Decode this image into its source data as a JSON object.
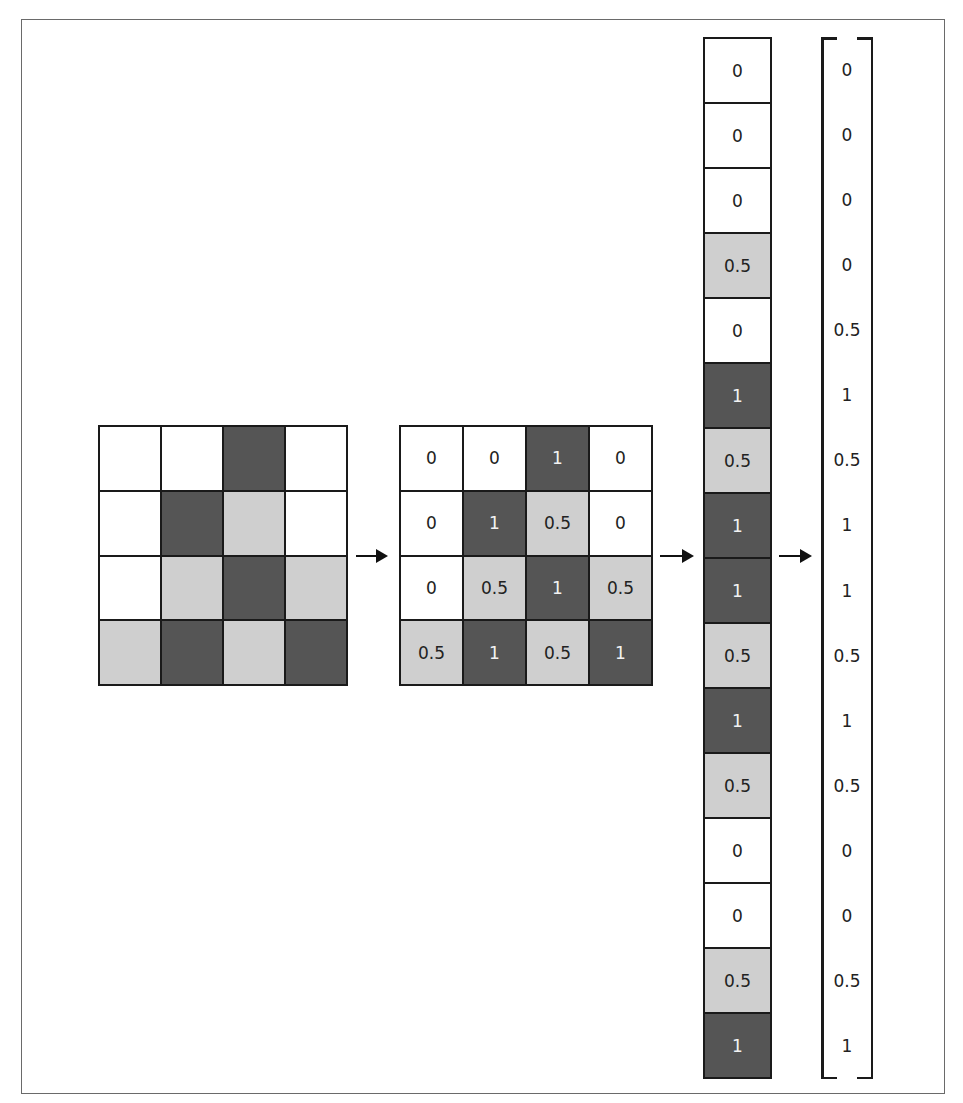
{
  "colors": {
    "white": "#ffffff",
    "light_gray": "#cfcfcf",
    "dark_gray": "#555555",
    "line": "#1a1a1a"
  },
  "legend_mapping": {
    "white": "0",
    "light_gray": "0.5",
    "dark_gray": "1"
  },
  "image_grid": {
    "rows": [
      [
        "0",
        "0",
        "1",
        "0"
      ],
      [
        "0",
        "1",
        "0.5",
        "0"
      ],
      [
        "0",
        "0.5",
        "1",
        "0.5"
      ],
      [
        "0.5",
        "1",
        "0.5",
        "1"
      ]
    ]
  },
  "value_grid": {
    "rows": [
      [
        "0",
        "0",
        "1",
        "0"
      ],
      [
        "0",
        "1",
        "0.5",
        "0"
      ],
      [
        "0",
        "0.5",
        "1",
        "0.5"
      ],
      [
        "0.5",
        "1",
        "0.5",
        "1"
      ]
    ]
  },
  "column_vector": [
    "0",
    "0",
    "0",
    "0.5",
    "0",
    "1",
    "0.5",
    "1",
    "1",
    "0.5",
    "1",
    "0.5",
    "0",
    "0",
    "0.5",
    "1"
  ],
  "bracket_vector": [
    "0",
    "0",
    "0",
    "0",
    "0.5",
    "1",
    "0.5",
    "1",
    "1",
    "0.5",
    "1",
    "0.5",
    "0",
    "0",
    "0.5",
    "1"
  ]
}
